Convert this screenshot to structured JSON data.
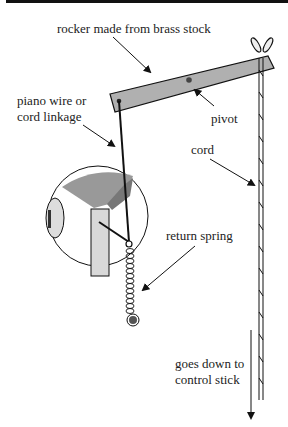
{
  "diagram": {
    "labels": {
      "rocker": "rocker made from brass stock",
      "linkage_line1": "piano wire or",
      "linkage_line2": "cord linkage",
      "pivot": "pivot",
      "cord": "cord",
      "return_spring": "return spring",
      "goes_down_line1": "goes down to",
      "goes_down_line2": "control stick"
    },
    "colors": {
      "rocker_fill": "#b0b0b0",
      "servo_horn_fill": "#8c8c8c",
      "servo_body_fill": "#d8d8d8",
      "line": "#111111"
    }
  }
}
